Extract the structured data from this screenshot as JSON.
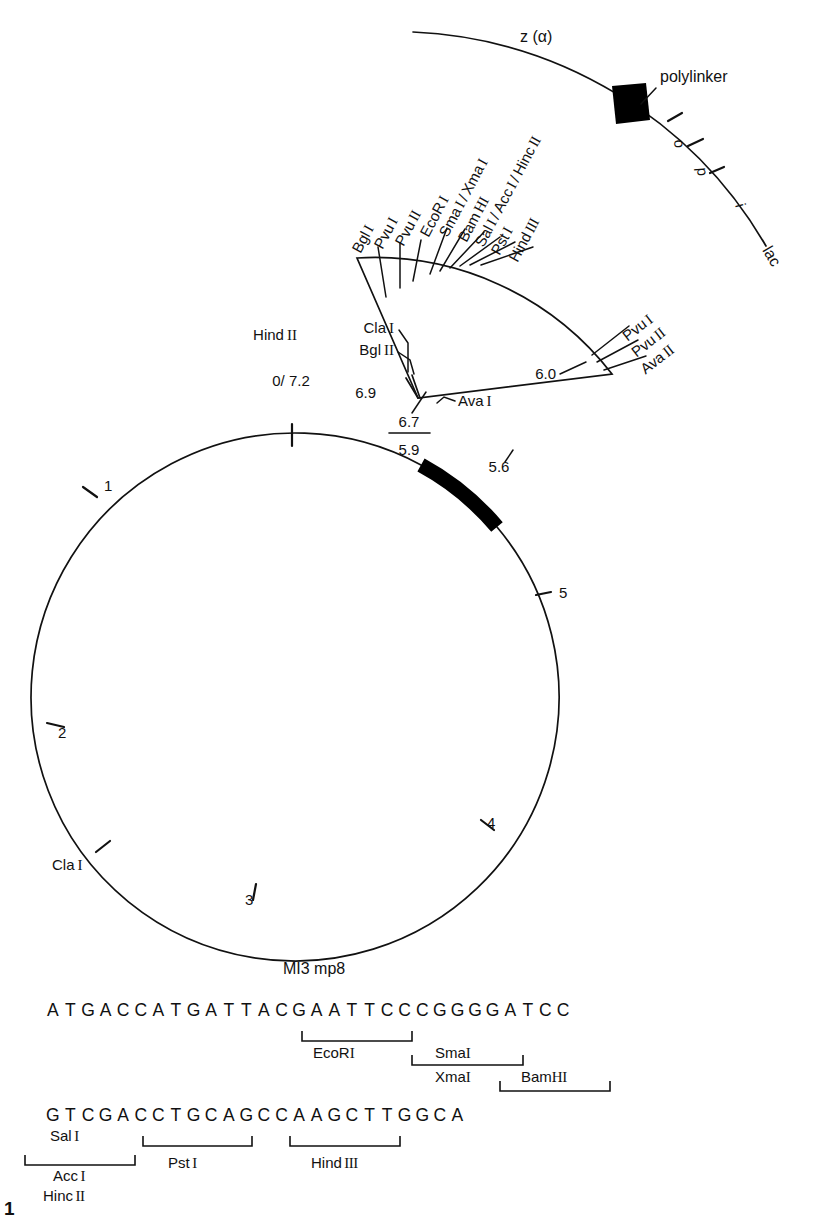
{
  "figure": {
    "number": "1",
    "title": "MI3 mp8",
    "type": "plasmid-restriction-map"
  },
  "circle_map": {
    "genome_label": "MI3 mp8",
    "scale_ticks": [
      {
        "label": "0/ 7.2",
        "position_kb": 0
      },
      {
        "label": "1",
        "position_kb": 1
      },
      {
        "label": "2",
        "position_kb": 2
      },
      {
        "label": "3",
        "position_kb": 3
      },
      {
        "label": "4",
        "position_kb": 4
      },
      {
        "label": "5",
        "position_kb": 5
      }
    ],
    "circle_sites": [
      {
        "label": "Hind",
        "roman": "II",
        "position_kb": 0.0
      },
      {
        "label": "Cla",
        "roman": "I",
        "position_kb": 2.45
      },
      {
        "label": "Cla",
        "roman": "I",
        "position_kb": 6.9
      },
      {
        "label": "Bgl",
        "roman": "II",
        "position_kb": 6.85
      }
    ],
    "coordinate_labels": [
      "6.9",
      "6.7",
      "5.9",
      "5.6",
      "6.0"
    ],
    "insert_arc": {
      "start_kb": "6.9",
      "end_kb": "5.6",
      "style": "thick-black-arc"
    },
    "ava_label": {
      "name": "Ava",
      "roman": "I"
    }
  },
  "lac_region": {
    "gene_label": "z (α)",
    "polylinker_label": "polylinker",
    "operon_segments": [
      "o",
      "p",
      "i"
    ],
    "operon_label": "lac"
  },
  "polylinker_sites": [
    {
      "name": "Bgl",
      "roman": "I"
    },
    {
      "name": "Pvu",
      "roman": "I"
    },
    {
      "name": "Pvu",
      "roman": "II"
    },
    {
      "name": "EcoR",
      "roman": "I"
    },
    {
      "name": "Sma",
      "roman": "I",
      "combo": "/ Xma",
      "combo_roman": "I"
    },
    {
      "name": "Bam",
      "roman": "HI"
    },
    {
      "name": "Sal",
      "roman": "I",
      "combo": "/ Acc",
      "combo_roman": "I",
      "combo2": "/ Hinc",
      "combo2_roman": "II"
    },
    {
      "name": "Pst",
      "roman": "I"
    },
    {
      "name": "Hind",
      "roman": "III"
    }
  ],
  "polylinker_sites_flat": [
    "Bgl I",
    "Pvu I",
    "Pvu II",
    "EcoR I",
    "Sma I / Xma I",
    "Bam HI",
    "Sal I / Acc I / Hinc II",
    "Pst I",
    "Hind III"
  ],
  "right_sites": [
    "Pvu I",
    "Pvu II",
    "Ava II"
  ],
  "right_sites_struct": [
    {
      "name": "Pvu",
      "roman": "I"
    },
    {
      "name": "Pvu",
      "roman": "II"
    },
    {
      "name": "Ava",
      "roman": "II"
    }
  ],
  "left_apex_sites": [
    {
      "name": "Cla",
      "roman": "I"
    },
    {
      "name": "Bgl",
      "roman": "II"
    }
  ],
  "sequence": {
    "line1": "ATGACCATGATTACGAATTCCCGGGGATCC",
    "line2": "GTCGACCTGCAGCCAAGCTTGGCA",
    "line1_annotations": [
      {
        "name": "EcoR",
        "roman": "I",
        "start": 13,
        "end": 19,
        "row": 0
      },
      {
        "name": "Sma",
        "roman": "I",
        "start": 18,
        "end": 24,
        "row": 1
      },
      {
        "name": "Xma",
        "roman": "I",
        "start": 18,
        "end": 24,
        "row": 2
      },
      {
        "name": "Bam",
        "roman": "HI",
        "start": 24,
        "end": 30,
        "row": 3
      }
    ],
    "line2_annotations": [
      {
        "name": "Sal",
        "roman": "I",
        "start": 0,
        "end": 6,
        "row": 0
      },
      {
        "name": "Acc",
        "roman": "I",
        "start": 0,
        "end": 6,
        "row": 1
      },
      {
        "name": "Hinc",
        "roman": "II",
        "start": 0,
        "end": 6,
        "row": 2
      },
      {
        "name": "Pst",
        "roman": "I",
        "start": 6,
        "end": 12,
        "row": 0
      },
      {
        "name": "Hind",
        "roman": "III",
        "start": 13,
        "end": 19,
        "row": 0
      }
    ]
  },
  "colors": {
    "ink": "#111111",
    "background": "#ffffff",
    "insert_fill": "#000000"
  }
}
